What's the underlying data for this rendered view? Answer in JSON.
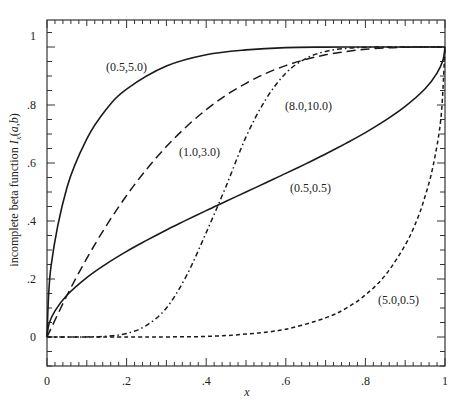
{
  "chart_data": {
    "type": "line",
    "title": "",
    "xlabel": "x",
    "ylabel": "incomplete beta function I_x(a,b)",
    "xlim": [
      0,
      1
    ],
    "ylim": [
      -0.1,
      1.05
    ],
    "grid": false,
    "legend": "inline labels",
    "x_ticks": [
      "0",
      ".2",
      ".4",
      ".6",
      ".8",
      "1"
    ],
    "y_ticks": [
      "0",
      ".2",
      ".4",
      ".6",
      ".8",
      "1"
    ],
    "series": [
      {
        "name": "(0.5,5.0)",
        "style": "solid",
        "label_pos": [
          106,
          71
        ],
        "x": [
          0,
          0.01,
          0.05,
          0.1,
          0.15,
          0.2,
          0.3,
          0.4,
          0.5,
          0.6,
          0.7,
          0.8,
          0.9,
          1.0
        ],
        "y": [
          0,
          0.243,
          0.515,
          0.683,
          0.787,
          0.855,
          0.934,
          0.973,
          0.99,
          0.998,
          0.9997,
          1.0,
          1.0,
          1.0
        ]
      },
      {
        "name": "(1.0,3.0)",
        "style": "dashed",
        "label_pos": [
          179,
          156
        ],
        "x": [
          0,
          0.05,
          0.1,
          0.15,
          0.2,
          0.25,
          0.3,
          0.35,
          0.4,
          0.45,
          0.5,
          0.55,
          0.6,
          0.65,
          0.7,
          0.75,
          0.8,
          0.85,
          0.9,
          0.95,
          1.0
        ],
        "y": [
          0,
          0.143,
          0.271,
          0.386,
          0.488,
          0.578,
          0.657,
          0.725,
          0.784,
          0.834,
          0.875,
          0.909,
          0.936,
          0.957,
          0.973,
          0.984,
          0.992,
          0.997,
          0.999,
          1.0,
          1.0
        ]
      },
      {
        "name": "(8.0,10.0)",
        "style": "dashdot",
        "label_pos": [
          285,
          110
        ],
        "x": [
          0,
          0.1,
          0.15,
          0.2,
          0.25,
          0.3,
          0.35,
          0.4,
          0.45,
          0.5,
          0.55,
          0.6,
          0.65,
          0.7,
          0.75,
          0.8,
          0.9,
          1.0
        ],
        "y": [
          0,
          0.0003,
          0.003,
          0.012,
          0.04,
          0.1,
          0.21,
          0.36,
          0.52,
          0.69,
          0.82,
          0.91,
          0.96,
          0.985,
          0.995,
          0.999,
          1.0,
          1.0
        ]
      },
      {
        "name": "(0.5,0.5)",
        "style": "solid",
        "label_pos": [
          290,
          192
        ],
        "x": [
          0,
          0.005,
          0.02,
          0.05,
          0.1,
          0.15,
          0.2,
          0.25,
          0.3,
          0.35,
          0.4,
          0.45,
          0.5,
          0.55,
          0.6,
          0.65,
          0.7,
          0.75,
          0.8,
          0.85,
          0.9,
          0.95,
          0.98,
          0.995,
          1.0
        ],
        "y": [
          0,
          0.045,
          0.09,
          0.144,
          0.205,
          0.253,
          0.295,
          0.333,
          0.369,
          0.403,
          0.436,
          0.468,
          0.5,
          0.532,
          0.564,
          0.597,
          0.631,
          0.667,
          0.705,
          0.747,
          0.795,
          0.856,
          0.91,
          0.955,
          1.0
        ]
      },
      {
        "name": "(5.0,0.5)",
        "style": "short-dashed",
        "label_pos": [
          378,
          304
        ],
        "x": [
          0,
          0.2,
          0.3,
          0.4,
          0.5,
          0.6,
          0.7,
          0.75,
          0.8,
          0.85,
          0.9,
          0.93,
          0.95,
          0.97,
          0.99,
          1.0
        ],
        "y": [
          0,
          0.0002,
          0.0005,
          0.002,
          0.01,
          0.027,
          0.066,
          0.098,
          0.145,
          0.213,
          0.317,
          0.405,
          0.485,
          0.59,
          0.757,
          1.0
        ]
      }
    ]
  }
}
